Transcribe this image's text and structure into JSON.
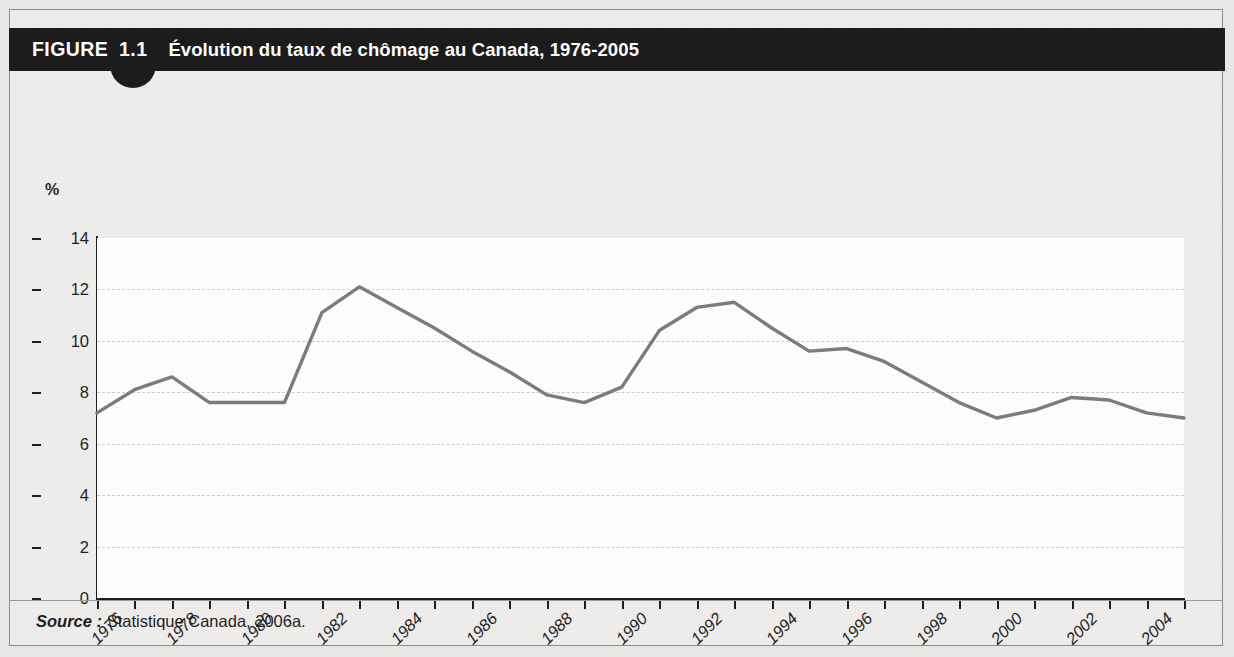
{
  "figure": {
    "label": "FIGURE",
    "number": "1.1",
    "title": "Évolution du taux de chômage au Canada, 1976-2005",
    "source_keyword": "Source :",
    "source_text": "Statistique Canada, 2006a.",
    "unit_label": "%"
  },
  "colors": {
    "title_bar": "#1c1c1c",
    "page_background": "#e9e9e7",
    "plot_background": "#ffffff",
    "line": "#7d7d7d",
    "gridline": "#cfcfcf",
    "axis": "#1f1f1f"
  },
  "chart_data": {
    "type": "line",
    "title": "Évolution du taux de chômage au Canada, 1976-2005",
    "xlabel": "",
    "ylabel": "%",
    "ylim": [
      0,
      14
    ],
    "ytick_step": 2,
    "yticks": [
      "0",
      "2",
      "4",
      "6",
      "8",
      "10",
      "12",
      "14"
    ],
    "xlim": [
      1976,
      2005
    ],
    "xtick_step": 1,
    "xtick_label_step": 2,
    "xticks": [
      1976,
      1977,
      1978,
      1979,
      1980,
      1981,
      1982,
      1983,
      1984,
      1985,
      1986,
      1987,
      1988,
      1989,
      1990,
      1991,
      1992,
      1993,
      1994,
      1995,
      1996,
      1997,
      1998,
      1999,
      2000,
      2001,
      2002,
      2003,
      2004,
      2005
    ],
    "xtick_labels": [
      "1976",
      "1978",
      "1980",
      "1982",
      "1984",
      "1986",
      "1988",
      "1990",
      "1992",
      "1994",
      "1996",
      "1998",
      "2000",
      "2002",
      "2004"
    ],
    "grid": true,
    "grid_axis": "y",
    "legend": false,
    "x": [
      1976,
      1977,
      1978,
      1979,
      1980,
      1981,
      1982,
      1983,
      1984,
      1985,
      1986,
      1987,
      1988,
      1989,
      1990,
      1991,
      1992,
      1993,
      1994,
      1995,
      1996,
      1997,
      1998,
      1999,
      2000,
      2001,
      2002,
      2003,
      2004,
      2005
    ],
    "values": [
      7.2,
      8.1,
      8.6,
      7.6,
      7.6,
      7.6,
      11.1,
      12.1,
      11.3,
      10.5,
      9.6,
      8.8,
      7.9,
      7.6,
      8.2,
      10.4,
      11.3,
      11.5,
      10.5,
      9.6,
      9.7,
      9.2,
      8.4,
      7.6,
      7.0,
      7.3,
      7.8,
      7.7,
      7.2,
      7.0
    ],
    "series": [
      {
        "name": "Taux de chômage",
        "values": [
          7.2,
          8.1,
          8.6,
          7.6,
          7.6,
          7.6,
          11.1,
          12.1,
          11.3,
          10.5,
          9.6,
          8.8,
          7.9,
          7.6,
          8.2,
          10.4,
          11.3,
          11.5,
          10.5,
          9.6,
          9.7,
          9.2,
          8.4,
          7.6,
          7.0,
          7.3,
          7.8,
          7.7,
          7.2,
          7.0
        ]
      }
    ]
  }
}
